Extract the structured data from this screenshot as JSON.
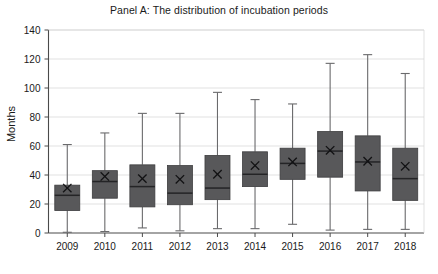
{
  "chart_data": {
    "type": "box",
    "title": "Panel A: The distribution of incubation periods",
    "xlabel": "",
    "ylabel": "Months",
    "ylim": [
      0,
      140
    ],
    "ytick_labels": [
      "0",
      "20",
      "40",
      "60",
      "80",
      "100",
      "120",
      "140"
    ],
    "ytick_values": [
      0,
      20,
      40,
      60,
      80,
      100,
      120,
      140
    ],
    "grid": true,
    "legend": "none",
    "categories": [
      "2009",
      "2010",
      "2011",
      "2012",
      "2013",
      "2014",
      "2015",
      "2016",
      "2017",
      "2018"
    ],
    "series": [
      {
        "name": "Incubation period distribution",
        "boxes": [
          {
            "category": "2009",
            "whisker_low": 0.5,
            "q1": 15.5,
            "median": 26.0,
            "q3": 33.0,
            "whisker_high": 61.0,
            "mean": 31.0
          },
          {
            "category": "2010",
            "whisker_low": 1.0,
            "q1": 24.0,
            "median": 35.5,
            "q3": 43.0,
            "whisker_high": 69.0,
            "mean": 39.0
          },
          {
            "category": "2011",
            "whisker_low": 3.5,
            "q1": 18.0,
            "median": 32.0,
            "q3": 47.0,
            "whisker_high": 82.5,
            "mean": 37.5
          },
          {
            "category": "2012",
            "whisker_low": 1.5,
            "q1": 19.5,
            "median": 27.5,
            "q3": 46.5,
            "whisker_high": 82.5,
            "mean": 37.0
          },
          {
            "category": "2013",
            "whisker_low": 3.0,
            "q1": 23.0,
            "median": 31.0,
            "q3": 53.5,
            "whisker_high": 97.0,
            "mean": 40.5
          },
          {
            "category": "2014",
            "whisker_low": 3.0,
            "q1": 32.0,
            "median": 40.5,
            "q3": 56.0,
            "whisker_high": 92.0,
            "mean": 46.5
          },
          {
            "category": "2015",
            "whisker_low": 6.0,
            "q1": 37.0,
            "median": 48.0,
            "q3": 58.5,
            "whisker_high": 89.0,
            "mean": 49.0
          },
          {
            "category": "2016",
            "whisker_low": 2.0,
            "q1": 38.5,
            "median": 56.5,
            "q3": 70.0,
            "whisker_high": 117.0,
            "mean": 57.0
          },
          {
            "category": "2017",
            "whisker_low": 2.5,
            "q1": 29.0,
            "median": 49.0,
            "q3": 67.0,
            "whisker_high": 123.0,
            "mean": 49.5
          },
          {
            "category": "2018",
            "whisker_low": 2.5,
            "q1": 22.5,
            "median": 37.5,
            "q3": 58.5,
            "whisker_high": 110.0,
            "mean": 46.0
          }
        ]
      }
    ],
    "colors": {
      "box_fill": "#58585a",
      "box_stroke": "#3d3d3f",
      "whisker": "#6a6a6c",
      "median": "#242426",
      "mean_marker": "#111113",
      "grid": "#d4d4d4",
      "axis": "#4a4a4a",
      "text": "#1a1a1a",
      "background": "#ffffff"
    },
    "mean_marker_symbol": "×"
  }
}
